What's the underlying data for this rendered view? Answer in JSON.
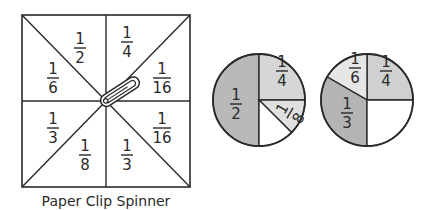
{
  "spinner": {
    "caption": "Paper Clip Spinner",
    "square": {
      "x": 22,
      "y": 15,
      "w": 168,
      "h": 172
    },
    "center": {
      "x": 106,
      "y": 101
    },
    "sections": [
      {
        "num": "1",
        "den": "2",
        "x": 80,
        "y": 48
      },
      {
        "num": "1",
        "den": "4",
        "x": 127,
        "y": 42
      },
      {
        "num": "1",
        "den": "6",
        "x": 53,
        "y": 78
      },
      {
        "num": "1",
        "den": "16",
        "x": 162,
        "y": 78
      },
      {
        "num": "1",
        "den": "3",
        "x": 53,
        "y": 128
      },
      {
        "num": "1",
        "den": "16",
        "x": 162,
        "y": 128
      },
      {
        "num": "1",
        "den": "8",
        "x": 85,
        "y": 155
      },
      {
        "num": "1",
        "den": "3",
        "x": 127,
        "y": 155
      }
    ]
  },
  "pies": [
    {
      "name": "pie-chart-1",
      "cx": 259,
      "cy": 100,
      "r": 46,
      "slices": [
        {
          "label_num": "1",
          "label_den": "2",
          "start": 90,
          "end": 270,
          "color": "#b9b9b9",
          "lx": 236,
          "ly": 104,
          "rotate": 0
        },
        {
          "label_num": "1",
          "label_den": "4",
          "start": 270,
          "end": 360,
          "color": "#d6d6d6",
          "lx": 282,
          "ly": 71,
          "rotate": 0
        },
        {
          "label_num": "1",
          "label_den": "8",
          "start": 0,
          "end": 45,
          "color": "#e0e0e0",
          "lx": 290,
          "ly": 113,
          "rotate": -60
        },
        {
          "label_num": "",
          "label_den": "",
          "start": 45,
          "end": 90,
          "color": "#ffffff",
          "lx": 0,
          "ly": 0,
          "rotate": 0
        }
      ]
    },
    {
      "name": "pie-chart-2",
      "cx": 367,
      "cy": 100,
      "r": 46,
      "slices": [
        {
          "label_num": "1",
          "label_den": "4",
          "start": 270,
          "end": 360,
          "color": "#d0d0d0",
          "lx": 386,
          "ly": 71,
          "rotate": 0
        },
        {
          "label_num": "1",
          "label_den": "6",
          "start": 210,
          "end": 270,
          "color": "#e6e6e6",
          "lx": 355,
          "ly": 68,
          "rotate": 0
        },
        {
          "label_num": "1",
          "label_den": "3",
          "start": 90,
          "end": 210,
          "color": "#b4b4b4",
          "lx": 347,
          "ly": 113,
          "rotate": 0
        },
        {
          "label_num": "",
          "label_den": "",
          "start": 0,
          "end": 90,
          "color": "#ffffff",
          "lx": 0,
          "ly": 0,
          "rotate": 0
        }
      ]
    }
  ],
  "colors": {
    "stroke": "#2a2a2a",
    "background": "#ffffff"
  }
}
